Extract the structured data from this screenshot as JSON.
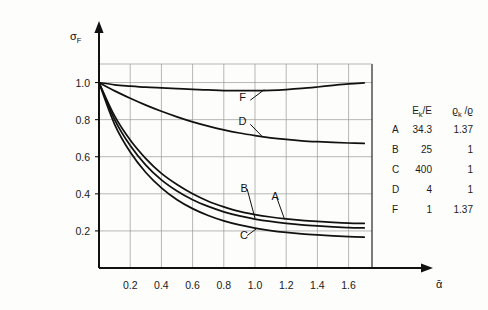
{
  "chart_data": {
    "type": "line",
    "title": "",
    "xlabel": "ᾱ",
    "ylabel": "σ_F",
    "xlim": [
      0,
      1.75
    ],
    "ylim": [
      0,
      1.1
    ],
    "xticks": [
      "0.2",
      "0.4",
      "0.6",
      "0.8",
      "1.0",
      "1.2",
      "1.4",
      "1.6"
    ],
    "xtick_values": [
      0.2,
      0.4,
      0.6,
      0.8,
      1.0,
      1.2,
      1.4,
      1.6
    ],
    "yticks": [
      "0.2",
      "0.4",
      "0.6",
      "0.8",
      "1.0"
    ],
    "ytick_values": [
      0.2,
      0.4,
      0.6,
      0.8,
      1.0
    ],
    "grid": true,
    "legend_position": "right-outside",
    "x": [
      0.0,
      0.1,
      0.2,
      0.3,
      0.4,
      0.5,
      0.6,
      0.7,
      0.8,
      0.9,
      1.0,
      1.1,
      1.2,
      1.3,
      1.4,
      1.5,
      1.6,
      1.7
    ],
    "series": [
      {
        "name": "A",
        "label": "A",
        "values": [
          1.0,
          0.82,
          0.69,
          0.59,
          0.51,
          0.45,
          0.4,
          0.36,
          0.33,
          0.305,
          0.288,
          0.275,
          0.265,
          0.257,
          0.251,
          0.246,
          0.242,
          0.24
        ]
      },
      {
        "name": "B",
        "label": "B",
        "values": [
          1.0,
          0.8,
          0.66,
          0.555,
          0.475,
          0.415,
          0.368,
          0.332,
          0.303,
          0.281,
          0.264,
          0.251,
          0.241,
          0.233,
          0.227,
          0.222,
          0.218,
          0.216
        ]
      },
      {
        "name": "C",
        "label": "C",
        "values": [
          1.0,
          0.775,
          0.625,
          0.515,
          0.432,
          0.368,
          0.32,
          0.283,
          0.254,
          0.232,
          0.215,
          0.202,
          0.192,
          0.184,
          0.178,
          0.173,
          0.169,
          0.166
        ]
      },
      {
        "name": "D",
        "label": "D",
        "values": [
          1.0,
          0.955,
          0.915,
          0.878,
          0.845,
          0.815,
          0.788,
          0.765,
          0.745,
          0.728,
          0.714,
          0.702,
          0.693,
          0.686,
          0.681,
          0.677,
          0.674,
          0.672
        ]
      },
      {
        "name": "F",
        "label": "F",
        "values": [
          1.0,
          0.988,
          0.981,
          0.975,
          0.971,
          0.967,
          0.963,
          0.96,
          0.957,
          0.956,
          0.956,
          0.958,
          0.962,
          0.968,
          0.976,
          0.985,
          0.993,
          0.998
        ]
      }
    ],
    "annotations": [
      {
        "label": "F",
        "x": 0.92,
        "y": 0.9
      },
      {
        "label": "D",
        "x": 0.92,
        "y": 0.77
      },
      {
        "label": "B",
        "x": 0.93,
        "y": 0.41
      },
      {
        "label": "A",
        "x": 1.13,
        "y": 0.365
      },
      {
        "label": "C",
        "x": 0.93,
        "y": 0.155
      }
    ]
  },
  "legend": {
    "headers": [
      "",
      "Eₖ/E",
      "ϱₖ /ϱ"
    ],
    "header_col1_main": "E",
    "header_col1_sub": "k",
    "header_col1_tail": "/E",
    "header_col2_main": "ϱ",
    "header_col2_sub": "k",
    "header_col2_tail": " /ϱ",
    "rows": [
      {
        "name": "A",
        "e_ratio": "34.3",
        "rho_ratio": "1.37"
      },
      {
        "name": "B",
        "e_ratio": "25",
        "rho_ratio": "1"
      },
      {
        "name": "C",
        "e_ratio": "400",
        "rho_ratio": "1"
      },
      {
        "name": "D",
        "e_ratio": "4",
        "rho_ratio": "1"
      },
      {
        "name": "F",
        "e_ratio": "1",
        "rho_ratio": "1.37"
      }
    ]
  },
  "axes": {
    "y_label_main": "σ",
    "y_label_sub": "F",
    "x_label": "ᾱ"
  },
  "colors": {
    "curve": "#111111",
    "grid": "#9a9a9a",
    "axis": "#111111",
    "background": "#fdfdfb"
  }
}
